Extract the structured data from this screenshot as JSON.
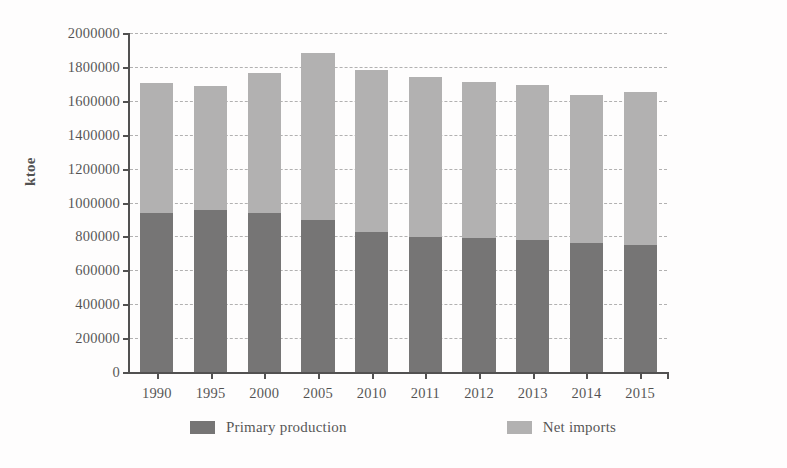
{
  "chart_data": {
    "type": "bar",
    "subtype": "stacked-vertical",
    "title": "",
    "xlabel": "",
    "ylabel": "ktoe",
    "ylim": [
      0,
      2000000
    ],
    "ytick_step": 200000,
    "yticks": [
      0,
      200000,
      400000,
      600000,
      800000,
      1000000,
      1200000,
      1400000,
      1600000,
      1800000,
      2000000
    ],
    "ytick_labels": [
      "0",
      "200000",
      "400000",
      "600000",
      "800000",
      "1000000",
      "1200000",
      "1400000",
      "1600000",
      "1800000",
      "2000000"
    ],
    "categories": [
      "1990",
      "1995",
      "2000",
      "2005",
      "2010",
      "2011",
      "2012",
      "2013",
      "2014",
      "2015"
    ],
    "series": [
      {
        "name": "Primary production",
        "color": "#4a4a4a",
        "values": [
          940000,
          955000,
          940000,
          895000,
          825000,
          795000,
          788000,
          780000,
          760000,
          752000
        ]
      },
      {
        "name": "Net imports",
        "color": "#9a9a9a",
        "values": [
          765000,
          730000,
          825000,
          985000,
          955000,
          945000,
          925000,
          915000,
          875000,
          898000
        ]
      }
    ],
    "totals": [
      1705000,
      1685000,
      1765000,
      1880000,
      1780000,
      1740000,
      1713000,
      1695000,
      1635000,
      1650000
    ],
    "grid": {
      "horizontal": true,
      "vertical": false,
      "style": "dashed",
      "color": "#9a9a9a"
    },
    "legend": {
      "position": "bottom",
      "entries": [
        "Primary production",
        "Net imports"
      ]
    },
    "axis_color": "#1a1a1a"
  },
  "legend": {
    "entries": [
      {
        "label": "Primary production",
        "color": "#4a4a4a",
        "swatch_name": "legend-swatch-primary-production"
      },
      {
        "label": "Net imports",
        "color": "#9a9a9a",
        "swatch_name": "legend-swatch-net-imports"
      }
    ]
  },
  "axes": {
    "y_title": "ktoe"
  }
}
